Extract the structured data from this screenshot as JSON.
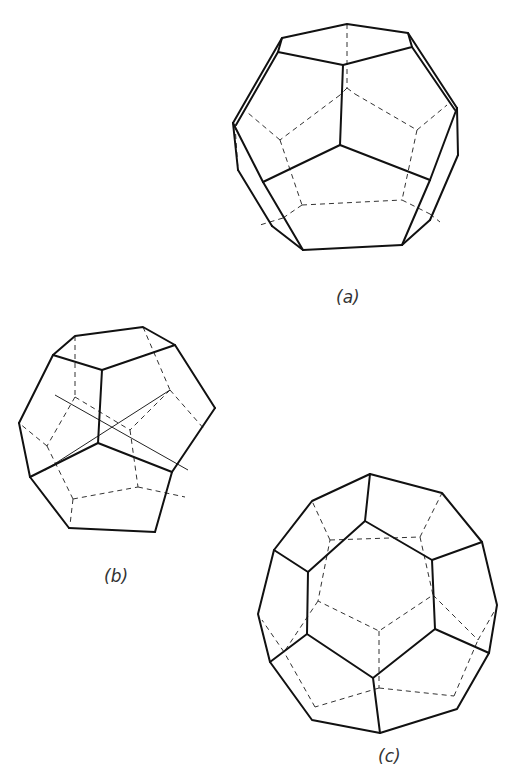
{
  "figure": {
    "colors": {
      "background": "#ffffff",
      "edges": "#111111",
      "hidden_edges": "#333333"
    },
    "panels": [
      {
        "id": "a",
        "label": "(a)",
        "view": "dodecahedron, oblique view from above"
      },
      {
        "id": "b",
        "label": "(b)",
        "view": "dodecahedron with crossing axis lines"
      },
      {
        "id": "c",
        "label": "(c)",
        "view": "dodecahedron viewed along a five-fold axis"
      }
    ]
  }
}
